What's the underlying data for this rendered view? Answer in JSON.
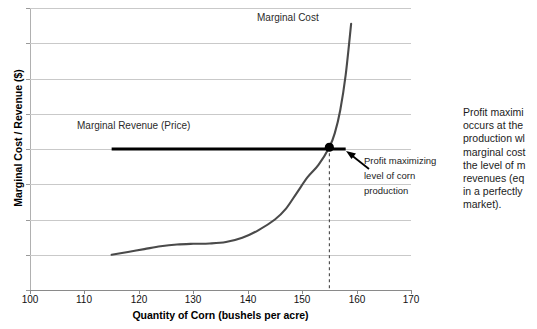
{
  "chart_data": {
    "type": "line",
    "title": "",
    "xlabel": "Quantity of Corn (bushels per acre)",
    "ylabel": "Marginal Cost / Revenue ($)",
    "xlim": [
      100,
      170
    ],
    "ylim": [
      0,
      8
    ],
    "xticks": [
      100,
      110,
      120,
      130,
      140,
      150,
      160,
      170
    ],
    "yticks": [
      0,
      1,
      2,
      3,
      4,
      5,
      6,
      7,
      8
    ],
    "grid": "horizontal",
    "legend": "inline-labels",
    "series": [
      {
        "name": "Marginal Cost",
        "color": "#4a4a4a",
        "x": [
          115,
          118,
          121,
          124,
          127,
          130,
          133,
          136,
          139,
          142,
          145,
          147,
          149,
          151,
          153,
          155,
          156,
          157,
          158,
          159
        ],
        "values": [
          1.0,
          1.08,
          1.16,
          1.24,
          1.29,
          1.31,
          1.32,
          1.36,
          1.48,
          1.7,
          2.0,
          2.3,
          2.75,
          3.2,
          3.55,
          4.05,
          4.45,
          5.1,
          6.1,
          7.55
        ]
      },
      {
        "name": "Marginal Revenue (Price)",
        "color": "#000000",
        "x": [
          115,
          158
        ],
        "values": [
          4.0,
          4.0
        ]
      }
    ],
    "annotations": [
      {
        "name": "intersection-point",
        "x": 155,
        "y": 4.05,
        "marker": "filled-circle",
        "color": "#000000"
      },
      {
        "name": "drop-line",
        "x": 155,
        "from_y": 4.05,
        "to_y": 0,
        "style": "dashed"
      }
    ]
  },
  "labels": {
    "marginal_cost": "Marginal  Cost",
    "marginal_revenue": "Marginal  Revenue (Price)",
    "y_axis_title": "Marginal Cost / Revenue ($)",
    "x_axis_title": "Quantity of Corn (bushels per acre)",
    "y_ticks": [
      "8",
      "7",
      "6",
      "5",
      "4",
      "3",
      "2",
      "1",
      "0"
    ],
    "x_ticks": [
      "100",
      "110",
      "120",
      "130",
      "140",
      "150",
      "160",
      "170"
    ]
  },
  "callout": {
    "line1": "Profit maximizing",
    "line2": "level of corn",
    "line3": "production"
  },
  "side_note": {
    "line1": "Profit maximi",
    "line2": "occurs at the",
    "line3": "production wl",
    "line4": "marginal cost",
    "line5": "the level of m",
    "line6": "revenues (eq",
    "line7": "in a perfectly",
    "line8": "market)."
  },
  "colors": {
    "mc_curve": "#4a4a4a",
    "mr_line": "#000000",
    "gridline": "#c9c9c9",
    "marker": "#000000",
    "background": "#ffffff"
  }
}
